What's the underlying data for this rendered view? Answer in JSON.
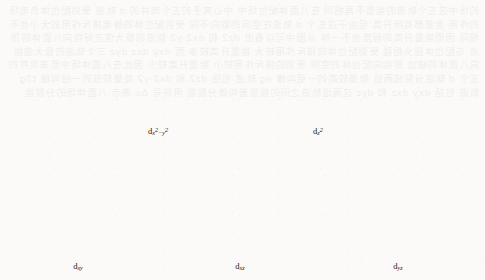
{
  "figure": {
    "title_visible": false,
    "background_note": "scanned textbook page with faint mirrored bleed-through text",
    "ghost_text": "的场中这五个轨道的能量不再相同 在八面体配位场中 中心离子的五个简并的 d 轨道 受到配位体负电场的作用 能量都有所升高 但由于这五个 d 轨道在空间的取向不同 受到配位体的静电排斥作用的大小也不相同 因而能量升高的程度也不一样 从图中可以看出 dz2 和 dx2-y2 轨道的极大值正好指向八面体的顶点 与配位体迎头相碰 受到配位体的排斥作用较大 能量升高较多 而 dxy dxz dyz 三个轨道的极大值指向八面体的棱边 即指向配位体的空隙 受到的排斥作用较小 能量升高较少 因此在八面体场中原来简并的五个 d 轨道分裂成两组 能量较高的一组叫做 eg 轨道 包括 dz2 和 dx2-y2 能量较低的一组叫做 t2g 轨道 包括 dxy dxz 和 dyz 这两组轨道之间的能量差叫做分裂能 用符号 Δo 表示 八面体场的分裂能",
    "axes": {
      "z": "z",
      "y": "y",
      "x": "x"
    },
    "ligand_count": 6,
    "colors": {
      "line": "#1a1a1a",
      "ligand": "#141414",
      "lobe_fill": "#ffffff",
      "paper": "#fbfaf8"
    },
    "orbitals": [
      {
        "id": "dx2-y2",
        "label_main": "d",
        "label_sub_pre": "x",
        "label_sup_pre": "2",
        "label_sub_mid": "−y",
        "label_sup_post": "2",
        "label_plain": "dx2−y2",
        "lobe_style": "four-lobe-axial",
        "description": "four lobes directed along the x and y axes toward the ligands",
        "cx": 158,
        "cy": 70,
        "label_x": 158,
        "label_y": 126
      },
      {
        "id": "dz2",
        "label_main": "d",
        "label_sub_pre": "z",
        "label_sup_pre": "2",
        "label_sub_mid": "",
        "label_sup_post": "",
        "label_plain": "dz2",
        "lobe_style": "dz2-torus",
        "description": "two lobes along z plus an equatorial torus in the xy plane",
        "cx": 318,
        "cy": 70,
        "label_x": 318,
        "label_y": 126
      },
      {
        "id": "dxy",
        "label_main": "d",
        "label_sub_pre": "xy",
        "label_sup_pre": "",
        "label_sub_mid": "",
        "label_sup_post": "",
        "label_plain": "dxy",
        "lobe_style": "four-lobe-diagonal-xy",
        "description": "four lobes in the xy plane pointing between the axes",
        "cx": 78,
        "cy": 205,
        "label_x": 78,
        "label_y": 261
      },
      {
        "id": "dxz",
        "label_main": "d",
        "label_sub_pre": "xz",
        "label_sup_pre": "",
        "label_sub_mid": "",
        "label_sup_post": "",
        "label_plain": "dxz",
        "lobe_style": "four-lobe-diagonal-xz",
        "description": "four lobes in the xz plane pointing between the axes",
        "cx": 240,
        "cy": 205,
        "label_x": 240,
        "label_y": 261
      },
      {
        "id": "dyz",
        "label_main": "d",
        "label_sub_pre": "yz",
        "label_sup_pre": "",
        "label_sub_mid": "",
        "label_sup_post": "",
        "label_plain": "dyz",
        "lobe_style": "four-lobe-diagonal-yz",
        "description": "four lobes in the yz plane pointing between the axes",
        "cx": 398,
        "cy": 205,
        "label_x": 398,
        "label_y": 261
      }
    ]
  }
}
